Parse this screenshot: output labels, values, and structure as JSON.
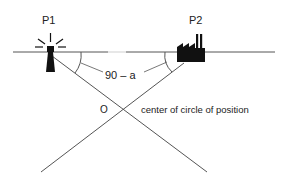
{
  "diagram": {
    "labels": {
      "p1": "P1",
      "p2": "P2",
      "angle": "90 – a",
      "center_point": "O",
      "center_caption": "center of circle of position"
    },
    "icons": {
      "p1": "lighthouse-icon",
      "p2": "factory-icon"
    },
    "colors": {
      "line": "#555555",
      "icon": "#111111",
      "text": "#222222"
    }
  }
}
